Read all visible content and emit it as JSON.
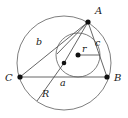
{
  "figure": {
    "type": "geometry-diagram",
    "canvas": {
      "width": 128,
      "height": 118
    },
    "colors": {
      "background": "#ffffff",
      "curve_stroke": "#6f6f6f",
      "line_stroke": "#555555",
      "point_fill": "#111111",
      "label_fill": "#1a1a1a"
    },
    "vertices": [
      {
        "id": "A",
        "label": "A",
        "x": 88,
        "y": 22,
        "label_x": 95,
        "label_y": 14
      },
      {
        "id": "B",
        "label": "B",
        "x": 107,
        "y": 77,
        "label_x": 115,
        "label_y": 80
      },
      {
        "id": "C",
        "label": "C",
        "x": 20,
        "y": 77,
        "label_x": 6,
        "label_y": 80
      }
    ],
    "centers": [
      {
        "id": "circumcenter",
        "x": 64,
        "y": 63,
        "radius_dot": 2.2
      },
      {
        "id": "incenter",
        "x": 78,
        "y": 55,
        "radius_dot": 2.4
      }
    ],
    "circles": [
      {
        "id": "circumcircle",
        "cx": 64,
        "cy": 63,
        "r": 47
      },
      {
        "id": "incircle",
        "cx": 78,
        "cy": 55,
        "r": 22
      }
    ],
    "side_labels": [
      {
        "id": "side-a",
        "label": "a",
        "x": 63,
        "y": 85,
        "note": "side BC"
      },
      {
        "id": "side-b",
        "label": "b",
        "x": 39,
        "y": 44,
        "note": "side CA"
      },
      {
        "id": "side-c",
        "label": "c",
        "x": 97,
        "y": 45,
        "note": "side AB"
      }
    ],
    "radius_labels": [
      {
        "id": "inradius",
        "label": "r",
        "x": 82,
        "y": 53,
        "note": "incircle radius"
      },
      {
        "id": "circumradius",
        "label": "R",
        "x": 43,
        "y": 96,
        "note": "circumcircle radius"
      }
    ],
    "radius_segments": [
      {
        "id": "inradius-segment",
        "x1": 78,
        "y1": 55,
        "x2": 100,
        "y2": 55
      },
      {
        "id": "circumradius-segment",
        "x1": 64,
        "y1": 63,
        "x2": 37,
        "y2": 101
      }
    ],
    "triangle_sides": [
      {
        "id": "ab",
        "x1": 88,
        "y1": 22,
        "x2": 107,
        "y2": 77
      },
      {
        "id": "bc",
        "x1": 107,
        "y1": 77,
        "x2": 20,
        "y2": 77
      },
      {
        "id": "ca",
        "x1": 20,
        "y1": 77,
        "x2": 88,
        "y2": 22
      }
    ],
    "cevians": [
      {
        "id": "a-to-incenter",
        "x1": 88,
        "y1": 22,
        "x2": 64,
        "y2": 63
      },
      {
        "id": "a-to-circumcenter",
        "x1": 88,
        "y1": 22,
        "x2": 56,
        "y2": 55
      }
    ]
  }
}
